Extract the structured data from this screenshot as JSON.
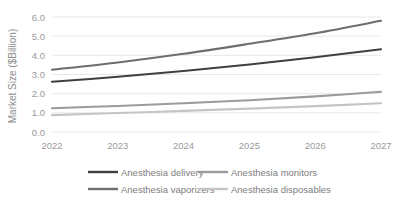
{
  "chart_data": {
    "type": "line",
    "title": "",
    "subtitle": "",
    "xlabel": "",
    "ylabel": "Market Size ($Billion)",
    "x": [
      2022,
      2023,
      2024,
      2025,
      2026,
      2027
    ],
    "categories": [
      "2022",
      "2023",
      "2024",
      "2025",
      "2026",
      "2027"
    ],
    "xlim": [
      2022,
      2027
    ],
    "ylim": [
      0.0,
      6.0
    ],
    "yticks": [
      "0.0",
      "1.0",
      "2.0",
      "3.0",
      "4.0",
      "5.0",
      "6.0"
    ],
    "ytick_values": [
      0.0,
      1.0,
      2.0,
      3.0,
      4.0,
      5.0,
      6.0
    ],
    "grid": "horizontal",
    "legend_position": "bottom",
    "series": [
      {
        "name": "Anesthesia delivery",
        "values": [
          2.62,
          2.88,
          3.18,
          3.52,
          3.9,
          4.32
        ],
        "color": "#404040"
      },
      {
        "name": "Anesthesia monitors",
        "values": [
          1.24,
          1.36,
          1.5,
          1.66,
          1.86,
          2.1
        ],
        "color": "#9b9b9b"
      },
      {
        "name": "Anesthesia vaporizers",
        "values": [
          3.25,
          3.63,
          4.08,
          4.6,
          5.15,
          5.8
        ],
        "color": "#6e6e6e"
      },
      {
        "name": "Anesthesia disposables",
        "values": [
          0.88,
          0.99,
          1.1,
          1.22,
          1.35,
          1.5
        ],
        "color": "#c4c4c4"
      }
    ]
  },
  "legend": {
    "entries": [
      {
        "label": "Anesthesia delivery",
        "color": "#404040"
      },
      {
        "label": "Anesthesia monitors",
        "color": "#9b9b9b"
      },
      {
        "label": "Anesthesia vaporizers",
        "color": "#6e6e6e"
      },
      {
        "label": "Anesthesia disposables",
        "color": "#c4c4c4"
      }
    ]
  },
  "style": {
    "background": "#ffffff",
    "gridline_color": "#e8e8e8",
    "tick_label_color": "#9a9a9a",
    "axis_title_color": "#8c8c8c",
    "legend_text_color": "#7d7d7d"
  }
}
